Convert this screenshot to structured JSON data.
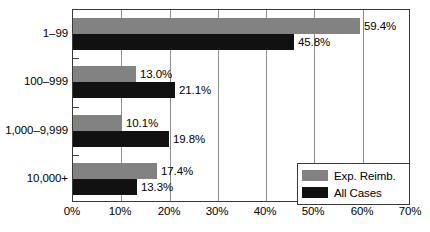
{
  "chart_data": {
    "type": "bar",
    "orientation": "horizontal",
    "title": "",
    "subtitle": "",
    "xlabel": "",
    "ylabel": "",
    "xlim": [
      0,
      70
    ],
    "xtick_step": 10,
    "grid": true,
    "legend_position": "bottom-right-inside",
    "categories": [
      "1–99",
      "100–999",
      "1,000–9,999",
      "10,000+"
    ],
    "tick_labels": [
      "0%",
      "10%",
      "20%",
      "30%",
      "40%",
      "50%",
      "60%",
      "70%"
    ],
    "series": [
      {
        "name": "Exp. Reimb.",
        "color": "#828282",
        "values": [
          59.4,
          13.0,
          10.1,
          17.4
        ],
        "labels": [
          "59.4%",
          "13.0%",
          "10.1%",
          "17.4%"
        ]
      },
      {
        "name": "All Cases",
        "color": "#111111",
        "values": [
          45.8,
          21.1,
          19.8,
          13.3
        ],
        "labels": [
          "45.8%",
          "21.1%",
          "19.8%",
          "13.3%"
        ]
      }
    ]
  },
  "legend": {
    "items": [
      {
        "label": "Exp. Reimb.",
        "color": "#828282"
      },
      {
        "label": "All Cases",
        "color": "#111111"
      }
    ]
  },
  "colors": {
    "series_a": "#828282",
    "series_b": "#111111",
    "frame": "#3a3a3a",
    "gridline": "#8d8d8d",
    "background": "#ffffff",
    "text": "#000000"
  }
}
